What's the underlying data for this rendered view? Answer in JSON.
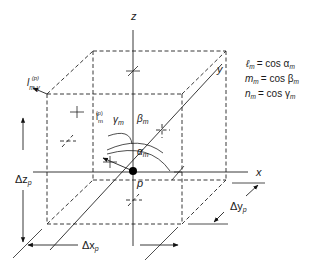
{
  "diagram": {
    "axes": {
      "x_label": "x",
      "y_label": "y",
      "z_label": "z"
    },
    "point": {
      "label": "p"
    },
    "vectors": {
      "unit_vector_base": "l",
      "unit_vector_sub": "m",
      "unit_vector_sup": "(p)",
      "face_vector_base": "l",
      "face_vector_sub": "m,γ",
      "face_vector_sup": "(p)"
    },
    "angles": {
      "alpha": "α",
      "alpha_sub": "m",
      "beta": "β",
      "beta_sub": "m",
      "gamma": "γ",
      "gamma_sub": "m"
    },
    "dimensions": {
      "dz": "Δz",
      "dz_sub": "p",
      "dx": "Δx",
      "dx_sub": "p",
      "dy": "Δy",
      "dy_sub": "p"
    },
    "equations": [
      {
        "lhs": "ℓ",
        "lhs_sub": "m",
        "rhs": "= cos α",
        "rhs_sub": "m"
      },
      {
        "lhs": "m",
        "lhs_sub": "m",
        "rhs": "= cos β",
        "rhs_sub": "m"
      },
      {
        "lhs": "n",
        "lhs_sub": "m",
        "rhs": "= cos γ",
        "rhs_sub": "m"
      }
    ]
  }
}
